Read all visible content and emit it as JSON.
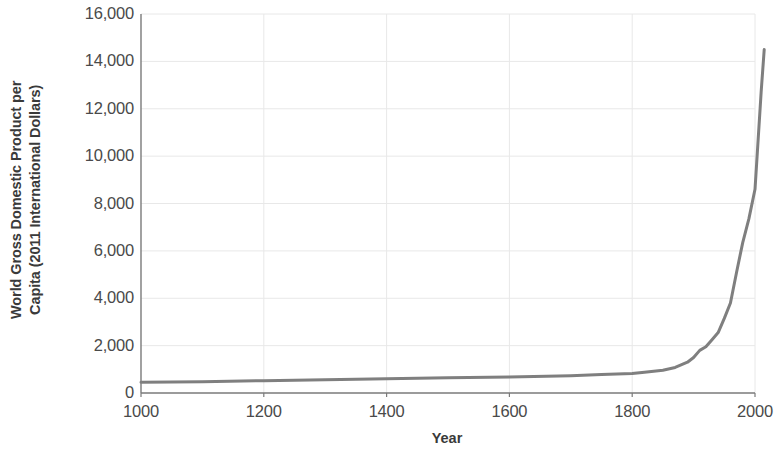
{
  "chart_data": {
    "type": "line",
    "title": "",
    "xlabel": "Year",
    "ylabel": "World Gross Domestic Product per Capita (2011 International Dollars)",
    "ylabel_lines": [
      "World Gross Domestic Product per",
      "Capita (2011 International Dollars)"
    ],
    "xlim": [
      1000,
      2000
    ],
    "ylim": [
      0,
      16000
    ],
    "x_ticks": [
      1000,
      1200,
      1400,
      1600,
      1800,
      2000
    ],
    "x_tick_labels": [
      "1000",
      "1200",
      "1400",
      "1600",
      "1800",
      "2000"
    ],
    "y_ticks": [
      0,
      2000,
      4000,
      6000,
      8000,
      10000,
      12000,
      14000,
      16000
    ],
    "y_tick_labels": [
      "0",
      "2,000",
      "4,000",
      "6,000",
      "8,000",
      "10,000",
      "12,000",
      "14,000",
      "16,000"
    ],
    "grid": true,
    "grid_color": "#e8e8e8",
    "legend": null,
    "series": [
      {
        "name": "World GDP per capita",
        "color": "#7f7f7f",
        "line_width": 3.0,
        "x": [
          1000,
          1100,
          1200,
          1300,
          1400,
          1500,
          1600,
          1700,
          1750,
          1800,
          1820,
          1850,
          1870,
          1890,
          1900,
          1910,
          1920,
          1930,
          1940,
          1950,
          1960,
          1970,
          1980,
          1990,
          2000,
          2010,
          2015
        ],
        "y": [
          450,
          480,
          520,
          560,
          600,
          640,
          680,
          730,
          780,
          820,
          880,
          960,
          1080,
          1300,
          1500,
          1800,
          1950,
          2250,
          2550,
          3150,
          3800,
          5100,
          6350,
          7350,
          8600,
          12700,
          14500
        ]
      }
    ]
  },
  "axes": {
    "axis_color": "#7a7a7a",
    "text_color": "#4a4a4a"
  }
}
